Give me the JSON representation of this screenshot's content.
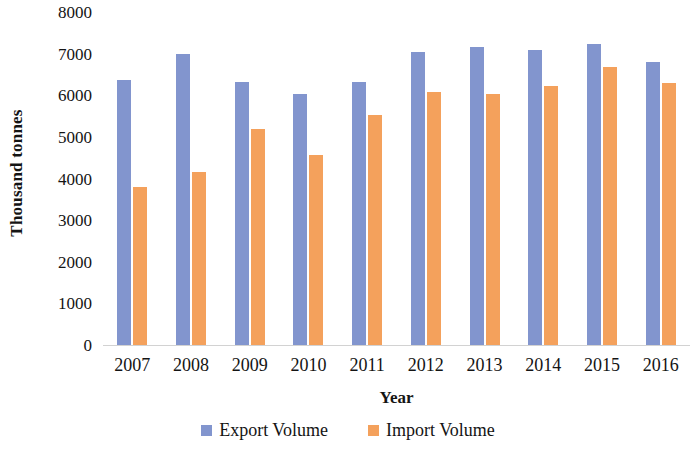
{
  "chart_data": {
    "type": "bar",
    "title": "",
    "subtitle": "",
    "xlabel": "Year",
    "ylabel": "Thousand tonnes",
    "categories": [
      "2007",
      "2008",
      "2009",
      "2010",
      "2011",
      "2012",
      "2013",
      "2014",
      "2015",
      "2016"
    ],
    "series": [
      {
        "name": "Export Volume",
        "color": "#8295ce",
        "values": [
          6370,
          7000,
          6320,
          6020,
          6330,
          7050,
          7160,
          7090,
          7220,
          6810
        ]
      },
      {
        "name": "Import Volume",
        "color": "#f4a15c",
        "values": [
          3790,
          4160,
          5180,
          4560,
          5520,
          6090,
          6030,
          6220,
          6690,
          6290
        ]
      }
    ],
    "ylim": [
      0,
      8000
    ],
    "ytick_step": 1000,
    "yticks": [
      "8000",
      "7000",
      "6000",
      "5000",
      "4000",
      "3000",
      "2000",
      "1000",
      "0"
    ],
    "grid": false,
    "legend_position": "bottom"
  },
  "legend": {
    "entries": [
      {
        "label": "Export Volume",
        "swatch_name": "legend-swatch-export"
      },
      {
        "label": "Import Volume",
        "swatch_name": "legend-swatch-import"
      }
    ]
  }
}
